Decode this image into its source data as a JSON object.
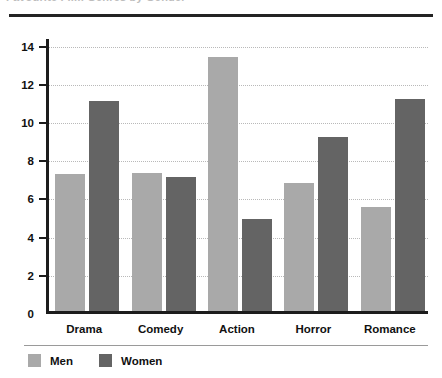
{
  "page": {
    "cropped_heading": "Favourite Film Genres by Gender",
    "background_color": "#ffffff"
  },
  "chart_data": {
    "type": "bar",
    "title": "",
    "xlabel": "",
    "ylabel": "",
    "categories": [
      "Drama",
      "Comedy",
      "Action",
      "Horror",
      "Romance"
    ],
    "series": [
      {
        "name": "Men",
        "color": "#a9a9a9",
        "values": [
          7.2,
          7.25,
          13.3,
          6.7,
          5.45
        ]
      },
      {
        "name": "Women",
        "color": "#646464",
        "values": [
          11.0,
          7.0,
          4.8,
          9.1,
          11.1
        ]
      }
    ],
    "ylim": [
      0,
      14.4
    ],
    "yticks": [
      0,
      2,
      4,
      6,
      8,
      10,
      12,
      14
    ],
    "ytick_labels": [
      "0",
      "2",
      "4",
      "6",
      "8",
      "10",
      "12",
      "14"
    ],
    "grid": true,
    "grid_style": "dotted-horizontal",
    "legend_position": "bottom-left"
  },
  "legend": {
    "items": [
      {
        "label": "Men",
        "swatch": "men"
      },
      {
        "label": "Women",
        "swatch": "women"
      }
    ]
  }
}
